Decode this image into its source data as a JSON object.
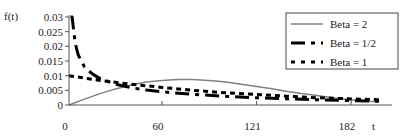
{
  "chart_data": {
    "type": "line",
    "title": "",
    "xlabel": "t",
    "ylabel": "f(t)",
    "xlim": [
      0,
      208
    ],
    "ylim": [
      0,
      0.03
    ],
    "x_ticks": [
      0,
      60,
      121,
      182
    ],
    "x_tick_labels": [
      "0",
      "60",
      "121",
      "182"
    ],
    "y_ticks": [
      0,
      0.005,
      0.01,
      0.015,
      0.02,
      0.025,
      0.03
    ],
    "y_tick_labels": [
      "0",
      "0.005",
      "0.01",
      "0.015",
      "0.02",
      "0.025",
      "0.03"
    ],
    "grid": false,
    "legend_position": "upper-right",
    "series": [
      {
        "name": "Beta = 2",
        "style": "solid-thin-gray",
        "color": "#808080",
        "x": [
          0,
          10,
          20,
          30,
          40,
          50,
          60,
          70,
          80,
          90,
          100,
          110,
          120,
          130,
          140,
          150,
          160,
          170,
          180,
          190,
          200
        ],
        "values": [
          0,
          0.002,
          0.0039,
          0.0055,
          0.0068,
          0.0078,
          0.0084,
          0.0087,
          0.0087,
          0.0084,
          0.0079,
          0.0072,
          0.0064,
          0.0056,
          0.0047,
          0.0039,
          0.0032,
          0.0025,
          0.0019,
          0.0014,
          0.001
        ]
      },
      {
        "name": "Beta = 1/2",
        "style": "long-dash-short-dash-thick",
        "color": "#000000",
        "x": [
          1,
          2,
          4,
          6,
          10,
          15,
          20,
          30,
          40,
          50,
          60,
          80,
          100,
          120,
          140,
          160,
          180,
          200
        ],
        "values": [
          0.03,
          0.03,
          0.021,
          0.017,
          0.013,
          0.0106,
          0.009,
          0.0071,
          0.0059,
          0.0051,
          0.0045,
          0.0036,
          0.003,
          0.0025,
          0.0021,
          0.0018,
          0.0015,
          0.0013
        ]
      },
      {
        "name": "Beta = 1",
        "style": "short-dash-thick",
        "color": "#000000",
        "x": [
          0,
          20,
          40,
          60,
          80,
          100,
          120,
          140,
          160,
          180,
          200
        ],
        "values": [
          0.01,
          0.0084,
          0.0071,
          0.006,
          0.005,
          0.0042,
          0.0036,
          0.003,
          0.0025,
          0.0021,
          0.0018
        ]
      }
    ]
  },
  "axis": {
    "ylabel": "f(t)",
    "xlabel": "t"
  },
  "legend": {
    "items": [
      {
        "label": "Beta = 2"
      },
      {
        "label": "Beta = 1/2"
      },
      {
        "label": "Beta = 1"
      }
    ]
  }
}
